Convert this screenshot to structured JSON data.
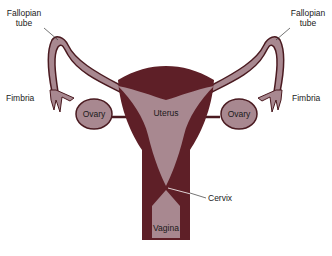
{
  "diagram": {
    "type": "anatomical-illustration",
    "colors": {
      "muscle_dark": "#5e1f27",
      "tissue_light": "#a88890",
      "outline": "#4a1a20",
      "leader_line": "#3a3a3a"
    },
    "labels": {
      "fallopian_left_1": "Fallopian",
      "fallopian_left_2": "tube",
      "fallopian_right_1": "Fallopian",
      "fallopian_right_2": "tube",
      "fimbria_left": "Fimbria",
      "fimbria_right": "Fimbria",
      "ovary_left": "Ovary",
      "ovary_right": "Ovary",
      "uterus": "Uterus",
      "cervix": "Cervix",
      "vagina": "Vagina"
    }
  }
}
